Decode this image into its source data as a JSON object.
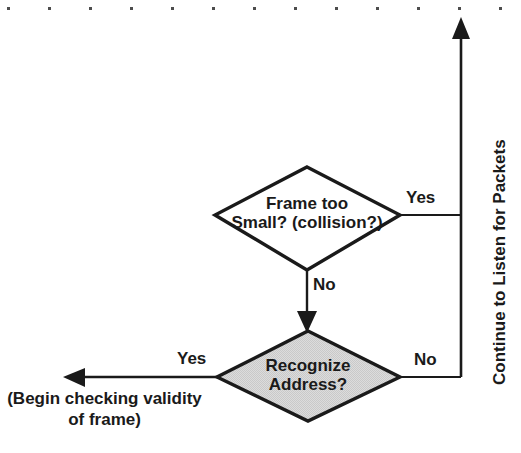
{
  "diagram": {
    "background_color": "#ffffff",
    "line_color": "#1a1a1a",
    "decision_fill_plain": "#ffffff",
    "decision_fill_shaded": "#d9d9d9",
    "top_dots": {
      "name": "top-dot-row",
      "count": 13,
      "color": "#4d4d4d"
    },
    "nodes": [
      {
        "id": "frame-too-small",
        "type": "decision",
        "shaded": false,
        "line1": "Frame too",
        "line2": "Small? (collision?)"
      },
      {
        "id": "recognize-address",
        "type": "decision",
        "shaded": true,
        "line1": "Recognize",
        "line2": "Address?"
      }
    ],
    "edge_labels": {
      "frame_small_yes": "Yes",
      "frame_small_no": "No",
      "recognize_yes": "Yes",
      "recognize_no": "No"
    },
    "annotations": {
      "return_path": "Continue to Listen for Packets",
      "exit_caption_line1": "(Begin checking validity",
      "exit_caption_line2": "of frame)"
    }
  }
}
